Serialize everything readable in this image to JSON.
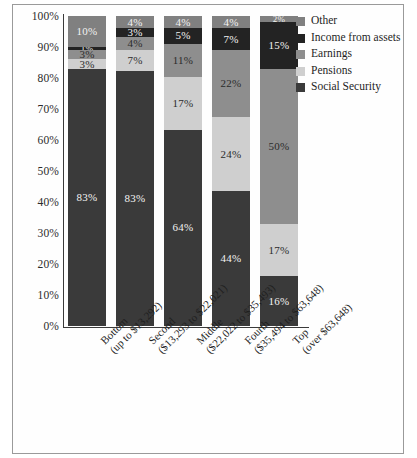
{
  "chart_data": {
    "type": "bar",
    "subtype": "stacked-bar-100pct",
    "title": "",
    "xlabel": "",
    "ylabel": "",
    "ylim": [
      0,
      100
    ],
    "grid": false,
    "legend_position": "right",
    "categories": [
      "Bottom (up to $13,292)",
      "Second ($13,293 to $22,021)",
      "Middle ($22,022 to $35,493)",
      "Fourth ($35,494 to $63,648)",
      "Top (over $63,648)"
    ],
    "category_lines": [
      {
        "line1": "Bottom",
        "line2": "(up to $13,292)"
      },
      {
        "line1": "Second",
        "line2": "($13,293 to $22,021)"
      },
      {
        "line1": "Middle",
        "line2": "($22,022 to $35,493)"
      },
      {
        "line1": "Fourth",
        "line2": "($35,494 to $63,648)"
      },
      {
        "line1": "Top",
        "line2": "(over $63,648)"
      }
    ],
    "ytick_labels": [
      "100%",
      "90%",
      "80%",
      "70%",
      "60%",
      "50%",
      "40%",
      "30%",
      "20%",
      "10%",
      "0%"
    ],
    "ytick_values": [
      100,
      90,
      80,
      70,
      60,
      50,
      40,
      30,
      20,
      10,
      0
    ],
    "series": [
      {
        "name": "Other",
        "color": "#808080",
        "values": [
          10,
          4,
          4,
          4,
          2
        ],
        "labels": [
          "10%",
          "4%",
          "4%",
          "4%",
          "2%"
        ]
      },
      {
        "name": "Income from assets",
        "color": "#232323",
        "values": [
          1,
          3,
          5,
          7,
          15
        ],
        "labels": [
          "1%",
          "3%",
          "5%",
          "7%",
          "15%"
        ]
      },
      {
        "name": "Earnings",
        "color": "#8e8e8e",
        "values": [
          3,
          4,
          11,
          22,
          50
        ],
        "labels": [
          "3%",
          "4%",
          "11%",
          "22%",
          "50%"
        ]
      },
      {
        "name": "Pensions",
        "color": "#cfcfcf",
        "values": [
          3,
          7,
          17,
          24,
          17
        ],
        "labels": [
          "3%",
          "7%",
          "17%",
          "24%",
          "17%"
        ]
      },
      {
        "name": "Social Security",
        "color": "#3a3a3a",
        "values": [
          83,
          83,
          64,
          44,
          16
        ],
        "labels": [
          "83%",
          "83%",
          "64%",
          "44%",
          "16%"
        ]
      }
    ]
  },
  "legend": {
    "items": [
      {
        "label": "Other",
        "color": "#808080"
      },
      {
        "label": "Income from assets",
        "color": "#232323"
      },
      {
        "label": "Earnings",
        "color": "#8e8e8e"
      },
      {
        "label": "Pensions",
        "color": "#cfcfcf"
      },
      {
        "label": "Social Security",
        "color": "#3a3a3a"
      }
    ]
  }
}
